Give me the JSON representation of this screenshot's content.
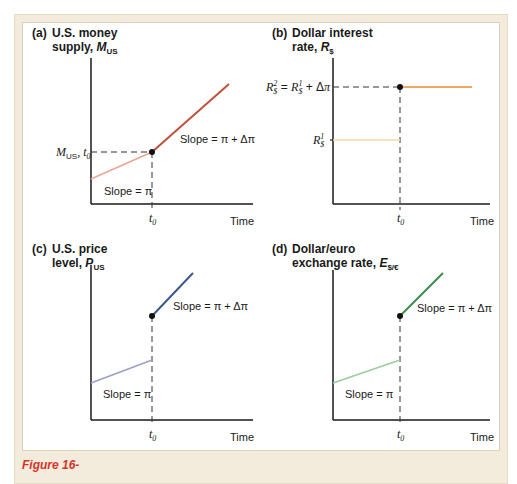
{
  "figure": {
    "caption_partial": "Figure 16-",
    "colors": {
      "frame_band": "#f3ecdc",
      "axis": "#1a1a1a",
      "dashed": "#333333",
      "caption": "#d8322a"
    }
  },
  "panels": [
    {
      "id": "a",
      "letter": "(a)",
      "title_line1": "U.S. money",
      "title_line2": "supply, ",
      "title_var": "M",
      "title_sub": "US",
      "y_marker": "M",
      "y_marker_sub": "US",
      "y_marker_suffix": ", t",
      "y_marker_suffix_sub": "0",
      "x_tick": "t",
      "x_tick_sub": "0",
      "x_label": "Time",
      "slope_before": "Slope = π",
      "slope_after": "Slope = π + Δπ",
      "color_before": "#e8a890",
      "color_after": "#c0503a"
    },
    {
      "id": "b",
      "letter": "(b)",
      "title_line1": "Dollar interest",
      "title_line2": "rate, ",
      "title_var": "R",
      "title_sub": "$",
      "y_marker_high": "R²$ = R¹$ + Δπ",
      "y_marker_low": "R¹$",
      "x_tick": "t",
      "x_tick_sub": "0",
      "x_label": "Time",
      "color_before": "#f5d8b0",
      "color_after": "#f0a860"
    },
    {
      "id": "c",
      "letter": "(c)",
      "title_line1": "U.S. price",
      "title_line2": "level, ",
      "title_var": "P",
      "title_sub": "US",
      "x_tick": "t",
      "x_tick_sub": "0",
      "x_label": "Time",
      "slope_before": "Slope = π",
      "slope_after": "Slope = π + Δπ",
      "color_before": "#9aa0c8",
      "color_after": "#3a5a8a"
    },
    {
      "id": "d",
      "letter": "(d)",
      "title_line1": "Dollar/euro",
      "title_line2": "exchange rate, ",
      "title_var": "E",
      "title_sub": "$/€",
      "x_tick": "t",
      "x_tick_sub": "0",
      "x_label": "Time",
      "slope_before": "Slope = π",
      "slope_after": "Slope = π + Δπ",
      "color_before": "#9ccc9c",
      "color_after": "#3a8a4a"
    }
  ]
}
